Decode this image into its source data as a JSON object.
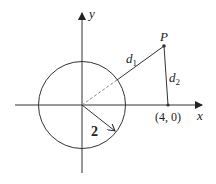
{
  "diagram": {
    "axes": {
      "x_label": "x",
      "y_label": "y"
    },
    "circle": {
      "radius_label": "2"
    },
    "point_P": {
      "label": "P"
    },
    "distance_labels": {
      "d1": "d",
      "d1_sub": "1",
      "d2": "d",
      "d2_sub": "2"
    },
    "point_fixed": {
      "label": "(4, 0)"
    },
    "colors": {
      "stroke": "#333333",
      "dashed": "#888888",
      "background": "#ffffff"
    }
  }
}
